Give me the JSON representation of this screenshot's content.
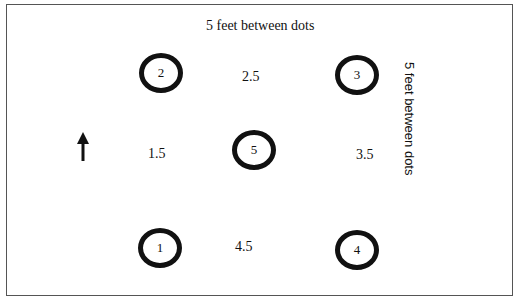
{
  "diagram": {
    "top_label": "5 feet between dots",
    "side_label": "5 feet between dots",
    "dots": [
      {
        "label": "1",
        "x": 160,
        "y": 247
      },
      {
        "label": "2",
        "x": 161,
        "y": 73
      },
      {
        "label": "3",
        "x": 357,
        "y": 75
      },
      {
        "label": "4",
        "x": 357,
        "y": 250
      },
      {
        "label": "5",
        "x": 254,
        "y": 150
      }
    ],
    "midpoints": [
      {
        "label": "1.5",
        "x": 158,
        "y": 155
      },
      {
        "label": "2.5",
        "x": 254,
        "y": 78
      },
      {
        "label": "3.5",
        "x": 366,
        "y": 156
      },
      {
        "label": "4.5",
        "x": 245,
        "y": 248
      }
    ],
    "arrow": {
      "direction": "up",
      "icon": "arrow-up-icon"
    }
  }
}
